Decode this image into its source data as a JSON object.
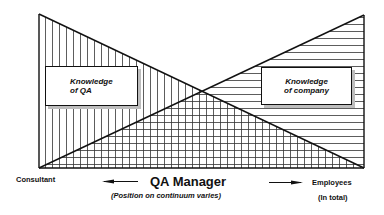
{
  "diagram": {
    "boxes": {
      "left": {
        "line1": "Knowledge",
        "line2": "of QA"
      },
      "right": {
        "line1": "Knowledge",
        "line2": "of company"
      }
    },
    "labels": {
      "left_end": "Consultant",
      "title": "QA Manager",
      "subtitle": "(Position on continuum varies)",
      "right_end": "Employees",
      "right_end_sub": "(In total)"
    },
    "patterns": {
      "knowledge_of_qa": "vertical-hatch",
      "knowledge_of_company": "horizontal-hatch"
    },
    "arrows": [
      "left-arrow",
      "right-arrow"
    ]
  }
}
